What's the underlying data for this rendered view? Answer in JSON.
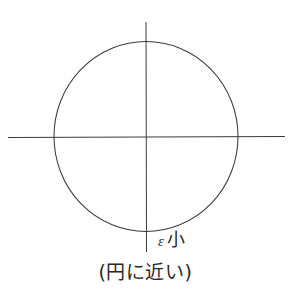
{
  "figure": {
    "background_color": "#ffffff",
    "stroke_color": "#3b3b3b",
    "text_color": "#2b2b2b",
    "width": 291,
    "height": 293,
    "labels": {
      "epsilon_symbol": "ε",
      "epsilon_qualifier": "小",
      "caption": "(円に近い)"
    },
    "icons": {
      "horizontal_axis": "horizontal-axis-line",
      "vertical_axis": "vertical-axis-line",
      "conic": "ellipse-near-circle"
    }
  },
  "chart_data": {
    "type": "scatter",
    "title": "",
    "subtitle": "",
    "xlabel": "",
    "ylabel": "",
    "annotations": [
      {
        "text": "ε 小",
        "x": 160,
        "y": 243,
        "role": "eccentricity-label"
      },
      {
        "text": "(円に近い)",
        "x": 145,
        "y": 278,
        "role": "figure-caption"
      }
    ],
    "legend": [],
    "grid": false,
    "axes": {
      "horizontal": {
        "y": 137,
        "x_start": 8,
        "x_end": 285
      },
      "vertical": {
        "x": 146,
        "y_start": 22,
        "y_end": 252
      }
    },
    "shapes": [
      {
        "name": "ellipse-near-circle",
        "type": "ellipse",
        "cx": 146,
        "cy": 136,
        "rx": 92,
        "ry": 95,
        "eccentricity_label": "ε 小",
        "description": "Ellipse with small eccentricity, nearly circular"
      }
    ],
    "xlim": [
      8,
      285
    ],
    "ylim": [
      22,
      252
    ]
  }
}
